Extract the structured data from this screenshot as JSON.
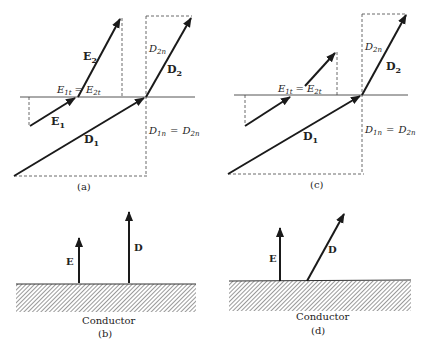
{
  "figure": {
    "panels": [
      {
        "id": "a",
        "caption": "(a)",
        "labels": {
          "E2": "E",
          "E2_sub": "2",
          "E1": "E",
          "E1_sub": "1",
          "D1": "D",
          "D1_sub": "1",
          "D2": "D",
          "D2_sub": "2",
          "Et_left": "E",
          "Et_left_sub": "1t",
          "Et_eq": "=",
          "Et_right": "E",
          "Et_right_sub": "2t",
          "D2n": "D",
          "D2n_sub": "2n",
          "Dn_left": "D",
          "Dn_left_sub": "1n",
          "Dn_eq": "=",
          "Dn_right": "D",
          "Dn_right_sub": "2n"
        }
      },
      {
        "id": "b",
        "caption": "(b)",
        "labels": {
          "E": "E",
          "D": "D",
          "surface": "Conductor"
        }
      },
      {
        "id": "c",
        "caption": "(c)",
        "labels": {
          "D1": "D",
          "D1_sub": "1",
          "D2": "D",
          "D2_sub": "2",
          "Et_left": "E",
          "Et_left_sub": "1t",
          "Et_eq": "=",
          "Et_right": "E",
          "Et_right_sub": "2t",
          "D2n": "D",
          "D2n_sub": "2n",
          "Dn_left": "D",
          "Dn_left_sub": "1n",
          "Dn_eq": "=",
          "Dn_right": "D",
          "Dn_right_sub": "2n"
        }
      },
      {
        "id": "d",
        "caption": "(d)",
        "labels": {
          "E": "E",
          "D": "D",
          "surface": "Conductor"
        }
      }
    ],
    "colors": {
      "ink": "#1a1a1a",
      "dash": "#444444",
      "hatch": "#555555"
    }
  }
}
